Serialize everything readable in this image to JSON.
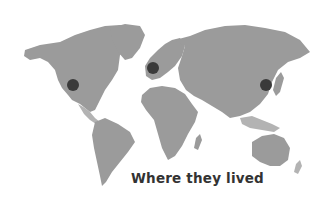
{
  "caption": "Where they lived",
  "colors": {
    "background": "#ffffff",
    "land": "#9b9b9b",
    "land_light": "#b3b3b3",
    "marker": "#3a3a3a",
    "caption": "#333333"
  },
  "markers": [
    {
      "name": "western-north-america",
      "x": 73,
      "y": 85,
      "r": 6
    },
    {
      "name": "western-europe",
      "x": 153,
      "y": 68,
      "r": 6
    },
    {
      "name": "east-asia",
      "x": 266,
      "y": 85,
      "r": 6
    }
  ]
}
